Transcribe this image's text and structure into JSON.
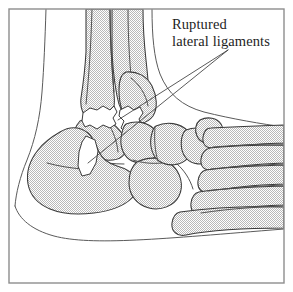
{
  "figure": {
    "kind": "anatomical-line-illustration",
    "background_color": "#ffffff",
    "frame": {
      "name": "figure-border",
      "stroke_color": "#8d8d8d",
      "x": 9,
      "y": 9,
      "width": 275,
      "height": 274
    },
    "bone_fill_color": "#d9d9d9",
    "bone_outline_color": "#3a3a3a",
    "gap_fill_color": "#ffffff",
    "skin_contour_color": "#5a5a5a"
  },
  "annotation": {
    "name": "ruptured-lateral-ligaments",
    "line1": "Ruptured",
    "line2": "lateral ligaments",
    "text_color": "#1d1d1d",
    "leader_origin": {
      "x": 228,
      "y": 50
    },
    "leader_targets": [
      {
        "name": "anterior-talofibular-rupture",
        "x": 118,
        "y": 120
      },
      {
        "name": "calcaneofibular-rupture",
        "x": 88,
        "y": 163
      }
    ]
  },
  "bones": [
    {
      "name": "tibia-shaft",
      "label": "tibia"
    },
    {
      "name": "fibula-shaft",
      "label": "fibula"
    },
    {
      "name": "lateral-malleolus",
      "label": "lateral malleolus"
    },
    {
      "name": "talus",
      "label": "talus"
    },
    {
      "name": "calcaneus",
      "label": "calcaneus"
    },
    {
      "name": "navicular",
      "label": "navicular"
    },
    {
      "name": "cuboid",
      "label": "cuboid"
    },
    {
      "name": "cuneiform-lateral",
      "label": "lateral cuneiform"
    },
    {
      "name": "cuneiform-intermediate",
      "label": "intermediate cuneiform"
    },
    {
      "name": "metatarsal-first",
      "label": "first metatarsal"
    },
    {
      "name": "metatarsal-second",
      "label": "second metatarsal"
    },
    {
      "name": "metatarsal-third",
      "label": "third metatarsal"
    },
    {
      "name": "metatarsal-fourth",
      "label": "fourth metatarsal"
    },
    {
      "name": "metatarsal-fifth",
      "label": "fifth metatarsal"
    }
  ],
  "rupture_gaps": [
    {
      "name": "gap-upper-anterior",
      "description": "white jagged gap at anterior ankle joint"
    },
    {
      "name": "gap-upper-posterior",
      "description": "white jagged gap at talar neck"
    },
    {
      "name": "gap-calcaneal-wedge",
      "description": "white wedge notch on calcaneus"
    }
  ]
}
